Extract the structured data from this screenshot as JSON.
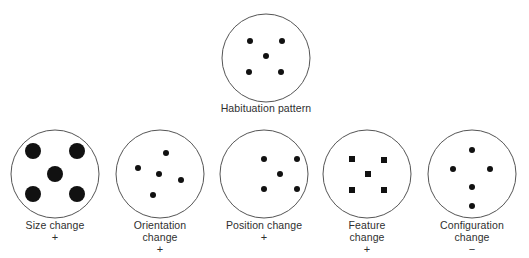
{
  "figure": {
    "colors": {
      "outline": "#555555",
      "dot": "#111111",
      "text": "#2f2f2f",
      "background": "#ffffff"
    },
    "habituation": {
      "label": "Habituation pattern",
      "circle": {
        "cx": 266,
        "cy": 58,
        "r": 44
      },
      "elements": [
        {
          "shape": "dot",
          "x": 250,
          "y": 41,
          "r": 3
        },
        {
          "shape": "dot",
          "x": 282,
          "y": 41,
          "r": 3
        },
        {
          "shape": "dot",
          "x": 266,
          "y": 56,
          "r": 3
        },
        {
          "shape": "dot",
          "x": 249,
          "y": 72,
          "r": 3
        },
        {
          "shape": "dot",
          "x": 281,
          "y": 72,
          "r": 3
        }
      ]
    },
    "tests": [
      {
        "id": "size",
        "label_lines": [
          "Size change"
        ],
        "sign": "+",
        "circle": {
          "cx": 55,
          "cy": 174,
          "r": 44
        },
        "elements": [
          {
            "shape": "dot",
            "x": 33,
            "y": 151,
            "r": 8
          },
          {
            "shape": "dot",
            "x": 77,
            "y": 151,
            "r": 8
          },
          {
            "shape": "dot",
            "x": 55,
            "y": 174,
            "r": 8
          },
          {
            "shape": "dot",
            "x": 33,
            "y": 194,
            "r": 8
          },
          {
            "shape": "dot",
            "x": 77,
            "y": 194,
            "r": 8
          }
        ]
      },
      {
        "id": "orientation",
        "label_lines": [
          "Orientation",
          "change"
        ],
        "sign": "+",
        "circle": {
          "cx": 160,
          "cy": 174,
          "r": 44
        },
        "elements": [
          {
            "shape": "dot",
            "x": 166,
            "y": 153,
            "r": 3
          },
          {
            "shape": "dot",
            "x": 138,
            "y": 168,
            "r": 3
          },
          {
            "shape": "dot",
            "x": 159,
            "y": 174,
            "r": 3
          },
          {
            "shape": "dot",
            "x": 181,
            "y": 180,
            "r": 3
          },
          {
            "shape": "dot",
            "x": 153,
            "y": 195,
            "r": 3
          }
        ]
      },
      {
        "id": "position",
        "label_lines": [
          "Position change"
        ],
        "sign": "+",
        "circle": {
          "cx": 264,
          "cy": 174,
          "r": 44
        },
        "elements": [
          {
            "shape": "dot",
            "x": 264,
            "y": 159,
            "r": 3
          },
          {
            "shape": "dot",
            "x": 297,
            "y": 159,
            "r": 3
          },
          {
            "shape": "dot",
            "x": 280,
            "y": 174,
            "r": 3
          },
          {
            "shape": "dot",
            "x": 264,
            "y": 189,
            "r": 3
          },
          {
            "shape": "dot",
            "x": 297,
            "y": 189,
            "r": 3
          }
        ]
      },
      {
        "id": "feature",
        "label_lines": [
          "Feature",
          "change"
        ],
        "sign": "+",
        "circle": {
          "cx": 367,
          "cy": 174,
          "r": 44
        },
        "elements": [
          {
            "shape": "square",
            "x": 352,
            "y": 159,
            "size": 6
          },
          {
            "shape": "square",
            "x": 384,
            "y": 160,
            "size": 6
          },
          {
            "shape": "square",
            "x": 368,
            "y": 174,
            "size": 6
          },
          {
            "shape": "square",
            "x": 352,
            "y": 190,
            "size": 6
          },
          {
            "shape": "square",
            "x": 384,
            "y": 190,
            "size": 6
          }
        ]
      },
      {
        "id": "configuration",
        "label_lines": [
          "Configuration",
          "change"
        ],
        "sign": "−",
        "circle": {
          "cx": 472,
          "cy": 174,
          "r": 44
        },
        "elements": [
          {
            "shape": "dot",
            "x": 472,
            "y": 150,
            "r": 3
          },
          {
            "shape": "dot",
            "x": 453,
            "y": 169,
            "r": 3
          },
          {
            "shape": "dot",
            "x": 490,
            "y": 169,
            "r": 3
          },
          {
            "shape": "dot",
            "x": 472,
            "y": 187,
            "r": 3
          },
          {
            "shape": "dot",
            "x": 472,
            "y": 206,
            "r": 3
          }
        ]
      }
    ]
  }
}
